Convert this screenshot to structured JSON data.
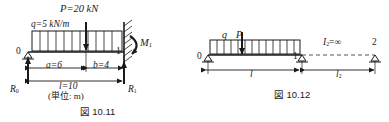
{
  "figures": [
    {
      "id": "fig-10-11",
      "caption": "図 10.11",
      "title_glyph": "図",
      "labels": {
        "point_load": "P=20 kN",
        "dist_load": "q=5 kN/m",
        "moment": "M",
        "moment_sub": "1",
        "node_left": "0",
        "node_right": "1",
        "dim_a": "a=6",
        "dim_b": "b=4",
        "dim_l": "l=10",
        "unit_note": "(単位: m)",
        "reaction_left": "R",
        "reaction_left_sub": "0",
        "reaction_right": "R",
        "reaction_right_sub": "1"
      },
      "geometry": {
        "span_length": 10,
        "segment_a": 6,
        "segment_b": 4,
        "point_load_kN": 20,
        "dist_load_kN_per_m": 5,
        "left_support": "roller-pin",
        "right_support": "fixed-wall",
        "hatch_count": 11
      }
    },
    {
      "id": "fig-10-12",
      "caption": "図 10.12",
      "title_glyph": "図",
      "labels": {
        "dist_load": "q",
        "point_load": "P",
        "inertia": "I",
        "inertia_sub": "2",
        "inertia_value": "=∞",
        "node_left": "0",
        "node_mid": "1",
        "node_right": "2",
        "dim_l": "l",
        "dim_l2": "l",
        "dim_l2_sub": "2"
      },
      "geometry": {
        "span1_label": "l",
        "span2_label": "l2",
        "span2_inertia": "infinity",
        "supports": [
          "pin",
          "pin",
          "pin"
        ],
        "hatch_count": 13,
        "rigid_link_style": "dashed"
      }
    }
  ],
  "colors": {
    "ink": "#1a1a1a",
    "background": "#ffffff",
    "dashed": "#555555"
  }
}
